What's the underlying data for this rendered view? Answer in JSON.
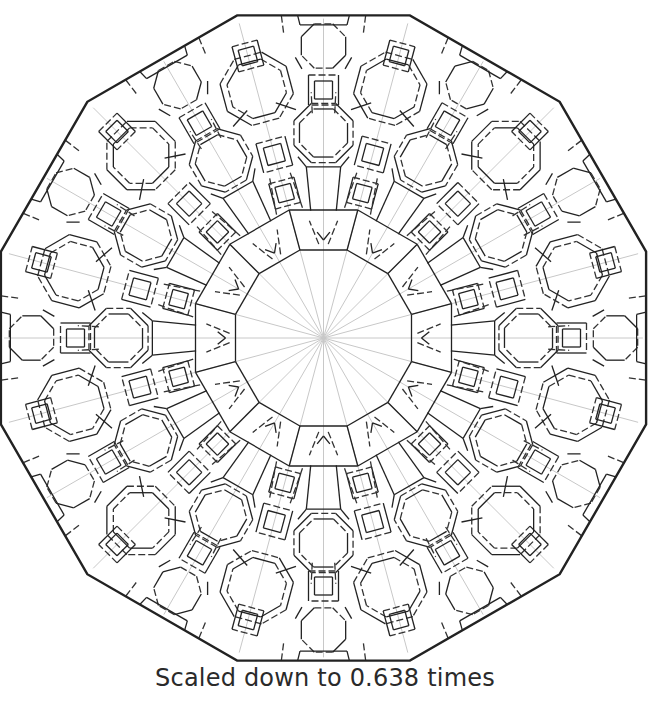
{
  "figure": {
    "type": "origami-crease-pattern",
    "shape": "dodecagon",
    "symmetry": 12,
    "center": [
      323.5,
      338
    ],
    "circumradius": 334,
    "radial_reference_lines": 24,
    "colors": {
      "border": "#222222",
      "mountain": "#222222",
      "valley": "#333333",
      "reference": "#c8c8c8",
      "background": "#ffffff"
    },
    "legend": {
      "mountain_fold": "solid line",
      "valley_fold": "dashed line",
      "reference": "light gray line"
    }
  },
  "caption": "Scaled down to 0.638 times"
}
